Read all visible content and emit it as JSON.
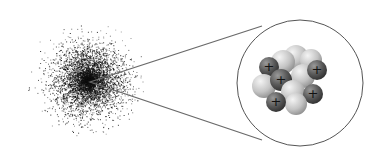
{
  "diagram": {
    "electron_cloud": {
      "cx": 88,
      "cy": 80,
      "r": 62,
      "color": "#111111"
    },
    "zoom_lines": {
      "origin": [
        90,
        82
      ],
      "top_end": [
        262,
        26
      ],
      "bottom_end": [
        262,
        140
      ],
      "color": "#6a6a6a"
    },
    "magnifier_circle": {
      "cx": 300,
      "cy": 83,
      "r": 63,
      "stroke": "#555555"
    },
    "nucleus": {
      "proton_color": "#5a5a5a",
      "neutron_color": "#c8c8c8",
      "proton_symbol": "+",
      "particles": [
        {
          "type": "neutron",
          "x": 296,
          "y": 57,
          "r": 12
        },
        {
          "type": "neutron",
          "x": 311,
          "y": 60,
          "r": 11
        },
        {
          "type": "neutron",
          "x": 283,
          "y": 62,
          "r": 12
        },
        {
          "type": "proton",
          "x": 269,
          "y": 67,
          "r": 10
        },
        {
          "type": "neutron",
          "x": 303,
          "y": 76,
          "r": 12
        },
        {
          "type": "proton",
          "x": 317,
          "y": 70,
          "r": 10
        },
        {
          "type": "neutron",
          "x": 264,
          "y": 86,
          "r": 12
        },
        {
          "type": "proton",
          "x": 281,
          "y": 80,
          "r": 11
        },
        {
          "type": "neutron",
          "x": 293,
          "y": 92,
          "r": 12
        },
        {
          "type": "proton",
          "x": 313,
          "y": 94,
          "r": 10
        },
        {
          "type": "neutron",
          "x": 296,
          "y": 104,
          "r": 11
        },
        {
          "type": "proton",
          "x": 276,
          "y": 102,
          "r": 10
        }
      ]
    }
  }
}
